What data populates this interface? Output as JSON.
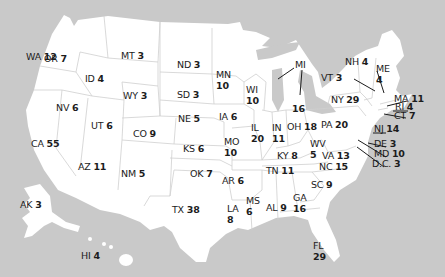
{
  "map": {
    "title": "Electoral votes by state",
    "colors": {
      "background": "#c9c9c9",
      "land": "#ffffff",
      "border": "#cfcfcf",
      "text": "#1c1c1c"
    },
    "states": [
      {
        "abbr": "WA",
        "votes": "12",
        "x": 40,
        "y": 56,
        "stack": false
      },
      {
        "abbr": "OR",
        "votes": "7",
        "x": 58,
        "y": 58,
        "stack": false
      },
      {
        "abbr": "ID",
        "votes": "4",
        "x": 99,
        "y": 78,
        "stack": false
      },
      {
        "abbr": "MT",
        "votes": "3",
        "x": 135,
        "y": 55,
        "stack": false
      },
      {
        "abbr": "WY",
        "votes": "3",
        "x": 137,
        "y": 95,
        "stack": false
      },
      {
        "abbr": "ND",
        "votes": "3",
        "x": 191,
        "y": 64,
        "stack": false
      },
      {
        "abbr": "SD",
        "votes": "3",
        "x": 191,
        "y": 94,
        "stack": false
      },
      {
        "abbr": "NE",
        "votes": "5",
        "x": 192,
        "y": 118,
        "stack": false
      },
      {
        "abbr": "MN",
        "votes": "10",
        "x": 230,
        "y": 74,
        "stack": true
      },
      {
        "abbr": "WI",
        "votes": "10",
        "x": 260,
        "y": 89,
        "stack": true
      },
      {
        "abbr": "IA",
        "votes": "6",
        "x": 233,
        "y": 116,
        "stack": false
      },
      {
        "abbr": "NV",
        "votes": "6",
        "x": 70,
        "y": 107,
        "stack": false
      },
      {
        "abbr": "UT",
        "votes": "6",
        "x": 105,
        "y": 125,
        "stack": false
      },
      {
        "abbr": "CO",
        "votes": "9",
        "x": 147,
        "y": 133,
        "stack": false
      },
      {
        "abbr": "KS",
        "votes": "6",
        "x": 197,
        "y": 148,
        "stack": false
      },
      {
        "abbr": "CA",
        "votes": "55",
        "x": 45,
        "y": 143,
        "stack": false
      },
      {
        "abbr": "AZ",
        "votes": "11",
        "x": 92,
        "y": 166,
        "stack": false
      },
      {
        "abbr": "NM",
        "votes": "5",
        "x": 135,
        "y": 173,
        "stack": false
      },
      {
        "abbr": "OK",
        "votes": "7",
        "x": 204,
        "y": 173,
        "stack": false
      },
      {
        "abbr": "TX",
        "votes": "38",
        "x": 186,
        "y": 209,
        "stack": false
      },
      {
        "abbr": "MO",
        "votes": "10",
        "x": 238,
        "y": 141,
        "stack": true
      },
      {
        "abbr": "AR",
        "votes": "6",
        "x": 236,
        "y": 180,
        "stack": false
      },
      {
        "abbr": "LA",
        "votes": "8",
        "x": 241,
        "y": 208,
        "stack": true
      },
      {
        "abbr": "MS",
        "votes": "6",
        "x": 260,
        "y": 200,
        "stack": true
      },
      {
        "abbr": "AL",
        "votes": "9",
        "x": 280,
        "y": 207,
        "stack": false
      },
      {
        "abbr": "GA",
        "votes": "16",
        "x": 307,
        "y": 197,
        "stack": true
      },
      {
        "abbr": "IL",
        "votes": "20",
        "x": 265,
        "y": 127,
        "stack": true
      },
      {
        "abbr": "IN",
        "votes": "11",
        "x": 286,
        "y": 127,
        "stack": true
      },
      {
        "abbr": "OH",
        "votes": "18",
        "x": 301,
        "y": 126,
        "stack": false
      },
      {
        "abbr": "KY",
        "votes": "8",
        "x": 291,
        "y": 155,
        "stack": false
      },
      {
        "abbr": "TN",
        "votes": "11",
        "x": 280,
        "y": 170,
        "stack": false
      },
      {
        "abbr": "MI",
        "votes": "16",
        "x": 301,
        "y": 60,
        "stack": false,
        "split": true
      },
      {
        "abbr": "WV",
        "votes": "5",
        "x": 324,
        "y": 143,
        "stack": true
      },
      {
        "abbr": "VA",
        "votes": "13",
        "x": 336,
        "y": 155,
        "stack": false
      },
      {
        "abbr": "NC",
        "votes": "15",
        "x": 333,
        "y": 166,
        "stack": false
      },
      {
        "abbr": "SC",
        "votes": "9",
        "x": 325,
        "y": 184,
        "stack": false
      },
      {
        "abbr": "FL",
        "votes": "29",
        "x": 327,
        "y": 245,
        "stack": true
      },
      {
        "abbr": "PA",
        "votes": "20",
        "x": 335,
        "y": 124,
        "stack": false
      },
      {
        "abbr": "NY",
        "votes": "29",
        "x": 345,
        "y": 99,
        "stack": false
      },
      {
        "abbr": "VT",
        "votes": "3",
        "x": 335,
        "y": 77,
        "stack": false
      },
      {
        "abbr": "NH",
        "votes": "4",
        "x": 359,
        "y": 61,
        "stack": false
      },
      {
        "abbr": "ME",
        "votes": "4",
        "x": 390,
        "y": 68,
        "stack": true
      },
      {
        "abbr": "MA",
        "votes": "11",
        "x": 408,
        "y": 98,
        "stack": false
      },
      {
        "abbr": "RI",
        "votes": "4",
        "x": 409,
        "y": 106,
        "stack": false
      },
      {
        "abbr": "CT",
        "votes": "7",
        "x": 408,
        "y": 115,
        "stack": false
      },
      {
        "abbr": "NJ",
        "votes": "14",
        "x": 388,
        "y": 128,
        "stack": false
      },
      {
        "abbr": "DE",
        "votes": "3",
        "x": 388,
        "y": 143,
        "stack": false
      },
      {
        "abbr": "MD",
        "votes": "10",
        "x": 388,
        "y": 153,
        "stack": false
      },
      {
        "abbr": "D.C.",
        "votes": "3",
        "x": 386,
        "y": 163,
        "stack": false
      },
      {
        "abbr": "AK",
        "votes": "3",
        "x": 34,
        "y": 204,
        "stack": false
      },
      {
        "abbr": "HI",
        "votes": "4",
        "x": 95,
        "y": 255,
        "stack": false
      }
    ]
  }
}
